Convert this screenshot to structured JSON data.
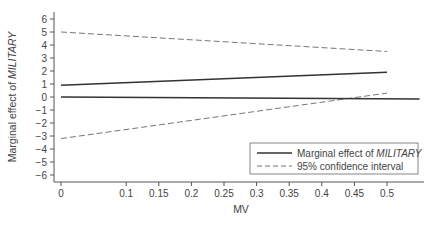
{
  "chart_data": {
    "type": "line",
    "title": "",
    "xlabel": "MV",
    "ylabel_prefix": "Marginal effect of ",
    "ylabel_emph": "MILITARY",
    "xlim": [
      0,
      0.55
    ],
    "ylim": [
      -6.5,
      6.5
    ],
    "x_ticks": [
      0,
      0.1,
      0.15,
      0.2,
      0.25,
      0.3,
      0.35,
      0.4,
      0.45,
      0.5
    ],
    "x_tick_labels": [
      "0",
      "0.1",
      "0.15",
      "0.2",
      "0.25",
      "0.3",
      "0.35",
      "0.4",
      "0.45",
      "0.5"
    ],
    "y_ticks": [
      6,
      5,
      4,
      3,
      2,
      1,
      0,
      -1,
      -2,
      -3,
      -4,
      -5,
      -6
    ],
    "y_tick_labels": [
      "6",
      "5",
      "4",
      "3",
      "2",
      "1",
      "0",
      "−1",
      "−2",
      "−3",
      "−4",
      "−5",
      "−6"
    ],
    "grid": false,
    "legend_position": "lower right",
    "series": [
      {
        "name": "Marginal effect of MILITARY",
        "style": "solid",
        "x": [
          0,
          0.5
        ],
        "values": [
          0.9,
          1.9
        ]
      },
      {
        "name": "95% confidence interval (upper)",
        "style": "dashed",
        "x": [
          0,
          0.5
        ],
        "values": [
          5.0,
          3.5
        ]
      },
      {
        "name": "95% confidence interval (lower)",
        "style": "dashed",
        "x": [
          0,
          0.5
        ],
        "values": [
          -3.2,
          0.3
        ]
      },
      {
        "name": "Zero reference line",
        "style": "solid",
        "x": [
          0,
          0.55
        ],
        "values": [
          0,
          -0.15
        ]
      }
    ],
    "legend": [
      {
        "label_prefix": "Marginal effect of ",
        "label_emph": "MILITARY",
        "style": "solid"
      },
      {
        "label": "95% confidence interval",
        "style": "dashed"
      }
    ]
  }
}
